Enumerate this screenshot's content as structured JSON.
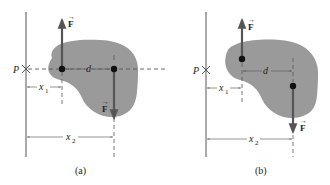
{
  "figure": {
    "colors": {
      "blob": "#9a9a9a",
      "arrow": "#555555",
      "line": "#555555",
      "dot": "#111111",
      "text": "#222222"
    },
    "panels": [
      {
        "id": "a",
        "caption": "(a)",
        "point_label": "P",
        "force_up_label": "F",
        "force_down_label": "F",
        "d_label": "d",
        "x1_label": "x",
        "x1_sub": "1",
        "x2_label": "x",
        "x2_sub": "2"
      },
      {
        "id": "b",
        "caption": "(b)",
        "point_label": "P",
        "force_up_label": "F",
        "force_down_label": "F",
        "d_label": "d",
        "x1_label": "x",
        "x1_sub": "1",
        "x2_label": "x",
        "x2_sub": "2"
      }
    ]
  }
}
